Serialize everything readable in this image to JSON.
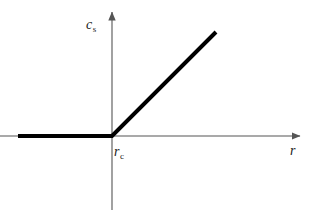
{
  "figure": {
    "background_color": "#ffffff",
    "axis_color": "#555555",
    "curve_color": "#000000",
    "label_color": "#1a1a1a",
    "y_axis_label": {
      "symbol": "c",
      "subscript": "s",
      "full_text": "c_s"
    },
    "x_axis_label": {
      "symbol": "r",
      "subscript": "",
      "full_text": "r"
    },
    "origin_label": {
      "symbol": "r",
      "subscript": "c",
      "full_text": "r_c"
    }
  },
  "chart_data": {
    "type": "line",
    "title": "",
    "xlabel": "r",
    "ylabel": "c_s",
    "grid": false,
    "legend": null,
    "annotations": [
      {
        "text": "r_c",
        "x": 0,
        "y": 0,
        "note": "threshold radius marked on x-axis at the kink"
      }
    ],
    "axes": {
      "x_axis": {
        "arrow": true,
        "pixel_y": 136,
        "pixel_x_start": 0,
        "pixel_x_end": 302,
        "origin_pixel_x": 112,
        "ticks": [],
        "ticklabels": []
      },
      "y_axis": {
        "arrow": true,
        "pixel_x": 112,
        "pixel_y_top": 10,
        "pixel_y_bottom": 210,
        "ticks": [],
        "ticklabels": []
      }
    },
    "series": [
      {
        "name": "c_s(r)",
        "description": "Piecewise linear: zero for r below r_c, then rising linearly for r above r_c",
        "linewidth_px": 4,
        "color": "#000000",
        "points_pixel": [
          {
            "x": 18,
            "y": 136
          },
          {
            "x": 112,
            "y": 136
          },
          {
            "x": 216,
            "y": 32
          }
        ],
        "points_data": [
          {
            "x": -0.9,
            "y": 0
          },
          {
            "x": 0,
            "y": 0
          },
          {
            "x": 1.0,
            "y": 1.0
          }
        ]
      }
    ]
  }
}
